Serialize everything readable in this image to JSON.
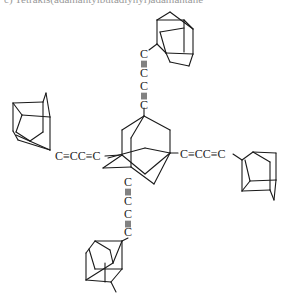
{
  "header": {
    "caption": "c) Tetrakis(adamantylbutadiynyl)adamantane"
  },
  "molecule": {
    "top_chain": {
      "c1": "C",
      "b1": "≡",
      "c2": "C",
      "c3": "C",
      "b2": "≡",
      "c4": "C"
    },
    "left_chain": {
      "text": "C≡CC≡C"
    },
    "right_chain": {
      "text": "C≡CC≡C"
    },
    "bottom_chain": {
      "c1": "C",
      "b1": "≡",
      "c2": "C",
      "c3": "C",
      "b2": "≡",
      "c4": "C"
    }
  }
}
